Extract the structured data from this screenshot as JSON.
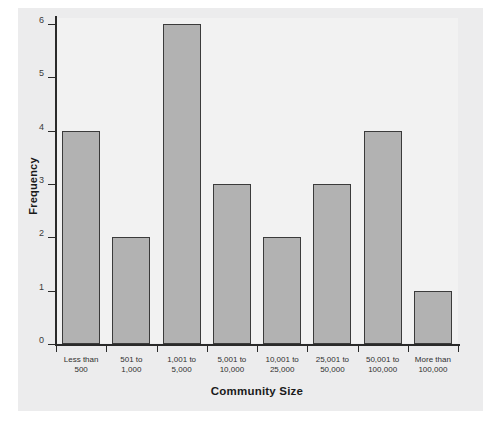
{
  "chart_data": {
    "type": "bar",
    "title": "",
    "subtitle": "",
    "xlabel": "Community Size",
    "ylabel": "Frequency",
    "categories": [
      "Less than 500",
      "501 to 1,000",
      "1,001 to 5,000",
      "5,001 to 10,000",
      "10,001 to 25,000",
      "25,001 to 50,000",
      "50,001 to 100,000",
      "More than 100,000"
    ],
    "category_lines": [
      [
        "Less than",
        "500"
      ],
      [
        "501 to",
        "1,000"
      ],
      [
        "1,001 to",
        "5,000"
      ],
      [
        "5,001 to",
        "10,000"
      ],
      [
        "10,001 to",
        "25,000"
      ],
      [
        "25,001 to",
        "50,000"
      ],
      [
        "50,001 to",
        "100,000"
      ],
      [
        "More than",
        "100,000"
      ]
    ],
    "values": [
      4,
      2,
      6,
      3,
      2,
      3,
      4,
      1
    ],
    "ylim": [
      0,
      6
    ],
    "ytick_labels": [
      "0",
      "1",
      "2",
      "3",
      "4",
      "5",
      "6"
    ],
    "grid": false,
    "legend": false,
    "legend_position": "none",
    "bar_color": "#b2b2b2",
    "bar_border_color": "#3b3b3b",
    "panel_color": "#ececed",
    "plot_background": "#f2f2f2",
    "axis_color": "#2a2a2a"
  }
}
